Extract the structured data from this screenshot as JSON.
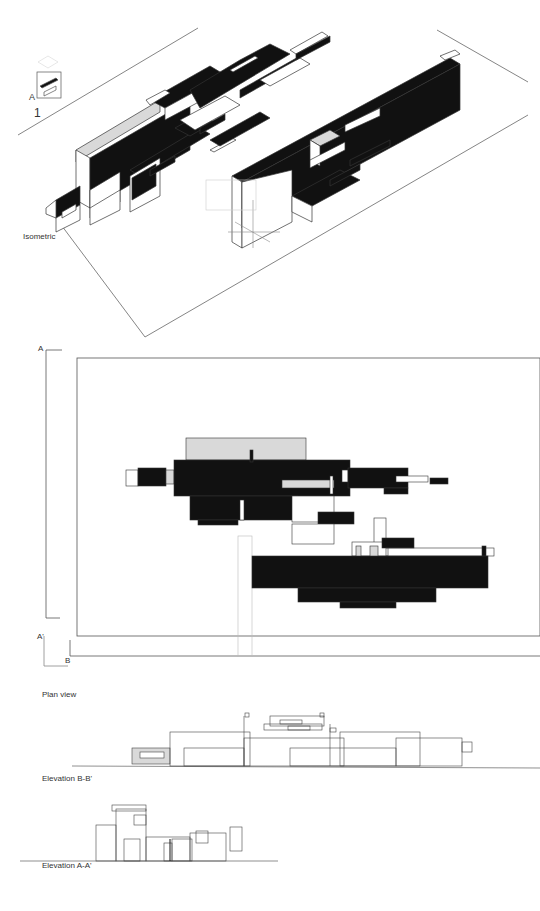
{
  "sheet": {
    "number": "1",
    "key_plan_marker": "A"
  },
  "isometric": {
    "caption": "Isometric"
  },
  "plan": {
    "caption": "Plan view",
    "section_markers": {
      "a_start": "A",
      "a_end": "A'",
      "b_start": "B"
    }
  },
  "elevation_bb": {
    "caption": "Elevation B-B'"
  },
  "elevation_aa": {
    "caption": "Elevation A-A'"
  },
  "colors": {
    "ink": "#111111",
    "line": "#555555",
    "fill_light": "#d9d9d9",
    "paper": "#ffffff"
  }
}
